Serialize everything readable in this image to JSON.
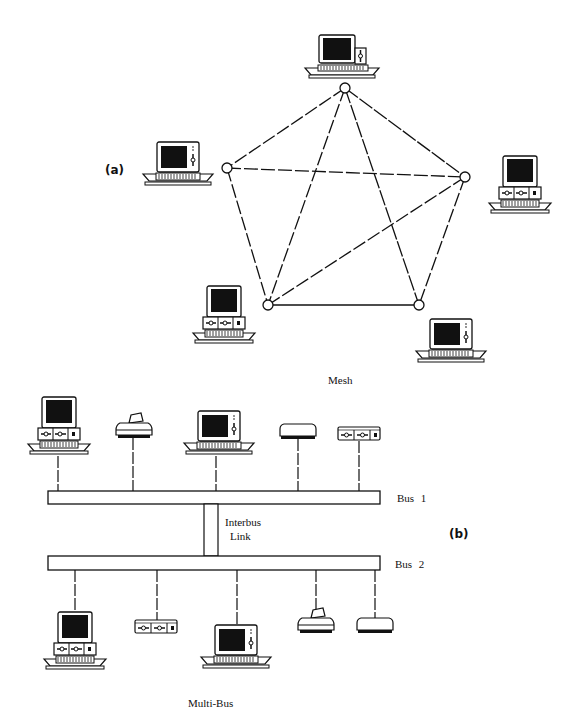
{
  "figure": {
    "part_a": {
      "label": "(a)",
      "caption": "Mesh",
      "nodes": [
        {
          "id": "n1",
          "x": 345,
          "y": 88,
          "device": "computer-tower"
        },
        {
          "id": "n2",
          "x": 227,
          "y": 168,
          "device": "computer-integrated"
        },
        {
          "id": "n3",
          "x": 465,
          "y": 177,
          "device": "computer-desktop"
        },
        {
          "id": "n4",
          "x": 268,
          "y": 305,
          "device": "computer-desktop"
        },
        {
          "id": "n5",
          "x": 419,
          "y": 305,
          "device": "computer-integrated"
        }
      ],
      "links": [
        [
          "n1",
          "n2"
        ],
        [
          "n1",
          "n3"
        ],
        [
          "n1",
          "n4"
        ],
        [
          "n1",
          "n5"
        ],
        [
          "n2",
          "n3"
        ],
        [
          "n2",
          "n4"
        ],
        [
          "n3",
          "n4"
        ],
        [
          "n3",
          "n5"
        ],
        [
          "n4",
          "n5"
        ]
      ]
    },
    "part_b": {
      "label": "(b)",
      "caption": "Multi-Bus",
      "bus1_label": "Bus 1",
      "bus2_label": "Bus 2",
      "interbus_label_line1": "Interbus",
      "interbus_label_line2": "Link",
      "bus1_devices": [
        "computer-desktop",
        "printer",
        "computer-integrated",
        "modem",
        "disk-drive-unit"
      ],
      "bus2_devices": [
        "computer-desktop",
        "disk-drive-unit",
        "computer-integrated",
        "printer",
        "modem"
      ]
    }
  }
}
